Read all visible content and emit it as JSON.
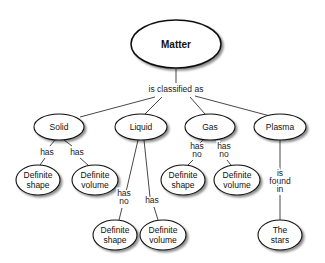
{
  "diagram": {
    "type": "concept-map",
    "root": {
      "id": "matter",
      "label": "Matter",
      "cx": 176,
      "cy": 44,
      "rx": 45,
      "ry": 24
    },
    "root_link": {
      "label": "is classified as",
      "x": 176,
      "y": 92
    },
    "nodes": [
      {
        "id": "solid",
        "lines": [
          "Solid"
        ],
        "cx": 59,
        "cy": 127,
        "rx": 25,
        "ry": 13
      },
      {
        "id": "liquid",
        "lines": [
          "Liquid"
        ],
        "cx": 141,
        "cy": 127,
        "rx": 26,
        "ry": 13
      },
      {
        "id": "gas",
        "lines": [
          "Gas"
        ],
        "cx": 210,
        "cy": 127,
        "rx": 25,
        "ry": 13
      },
      {
        "id": "plasma",
        "lines": [
          "Plasma"
        ],
        "cx": 280,
        "cy": 127,
        "rx": 26,
        "ry": 13
      },
      {
        "id": "solid-shape",
        "lines": [
          "Definite",
          "shape"
        ],
        "cx": 38,
        "cy": 180,
        "rx": 22,
        "ry": 15
      },
      {
        "id": "solid-volume",
        "lines": [
          "Definite",
          "volume"
        ],
        "cx": 95,
        "cy": 180,
        "rx": 23,
        "ry": 15
      },
      {
        "id": "gas-shape",
        "lines": [
          "Definite",
          "shape"
        ],
        "cx": 183,
        "cy": 180,
        "rx": 22,
        "ry": 15
      },
      {
        "id": "gas-volume",
        "lines": [
          "Definite",
          "volume"
        ],
        "cx": 237,
        "cy": 180,
        "rx": 23,
        "ry": 15
      },
      {
        "id": "liquid-shape",
        "lines": [
          "Definite",
          "shape"
        ],
        "cx": 115,
        "cy": 235,
        "rx": 22,
        "ry": 15
      },
      {
        "id": "liquid-volume",
        "lines": [
          "Definite",
          "volume"
        ],
        "cx": 163,
        "cy": 235,
        "rx": 23,
        "ry": 15
      },
      {
        "id": "stars",
        "lines": [
          "The",
          "stars"
        ],
        "cx": 280,
        "cy": 235,
        "rx": 22,
        "ry": 15
      }
    ],
    "links": [
      {
        "from": "matter",
        "to": "solid",
        "label": []
      },
      {
        "from": "matter",
        "to": "liquid",
        "label": []
      },
      {
        "from": "matter",
        "to": "gas",
        "label": []
      },
      {
        "from": "matter",
        "to": "plasma",
        "label": []
      },
      {
        "from": "solid",
        "to": "solid-shape",
        "label": [
          "has"
        ]
      },
      {
        "from": "solid",
        "to": "solid-volume",
        "label": [
          "has"
        ]
      },
      {
        "from": "gas",
        "to": "gas-shape",
        "label": [
          "has",
          "no"
        ]
      },
      {
        "from": "gas",
        "to": "gas-volume",
        "label": [
          "has",
          "no"
        ]
      },
      {
        "from": "liquid",
        "to": "liquid-shape",
        "label": [
          "has",
          "no"
        ]
      },
      {
        "from": "liquid",
        "to": "liquid-volume",
        "label": [
          "has"
        ]
      },
      {
        "from": "plasma",
        "to": "stars",
        "label": [
          "is",
          "found",
          "in"
        ]
      }
    ]
  }
}
